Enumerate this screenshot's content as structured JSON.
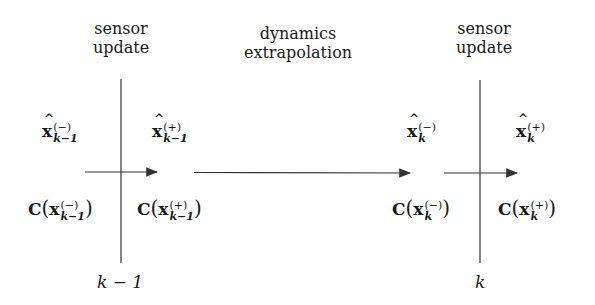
{
  "captions": {
    "left_sensor": [
      "sensor",
      "update"
    ],
    "dynamics": [
      "dynamics",
      "extrapolation"
    ],
    "right_sensor": [
      "sensor",
      "update"
    ]
  },
  "state_estimates": {
    "x_prev_minus": {
      "base": "x",
      "sup": "(−)",
      "sub": "k−1"
    },
    "x_prev_plus": {
      "base": "x",
      "sup": "(+)",
      "sub": "k−1"
    },
    "x_k_minus": {
      "base": "x",
      "sup": "(−)",
      "sub": "k"
    },
    "x_k_plus": {
      "base": "x",
      "sup": "(+)",
      "sub": "k"
    }
  },
  "covariances": {
    "C_prev_minus": {
      "fn": "C",
      "base": "x",
      "sup": "(−)",
      "sub": "k−1"
    },
    "C_prev_plus": {
      "fn": "C",
      "base": "x",
      "sup": "(+)",
      "sub": "k−1"
    },
    "C_k_minus": {
      "fn": "C",
      "base": "x",
      "sup": "(−)",
      "sub": "k"
    },
    "C_k_plus": {
      "fn": "C",
      "base": "x",
      "sup": "(+)",
      "sub": "k"
    }
  },
  "time_indices": {
    "left": "k − 1",
    "right": "k"
  },
  "colors": {
    "line": "#333333",
    "text": "#1a1a1a"
  }
}
